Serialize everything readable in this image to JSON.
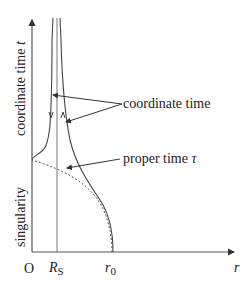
{
  "diagram": {
    "type": "spacetime-diagram",
    "y_axis": {
      "label_text": "coordinate time",
      "label_symbol": "t",
      "lower_label": "singularity"
    },
    "x_axis": {
      "label": "r",
      "origin": "O",
      "ticks": [
        {
          "label": "R",
          "sub": "S"
        },
        {
          "label": "r",
          "sub": "0"
        }
      ]
    },
    "annotations": [
      {
        "text": "coordinate time",
        "symbol": ""
      },
      {
        "text": "proper time",
        "symbol": "τ"
      }
    ],
    "curves": [
      {
        "name": "coordinate-time-outgoing",
        "style": "solid",
        "description": "from r0 rises, asymptotically approaches R_S from outside as t→∞"
      },
      {
        "name": "coordinate-time-ingoing",
        "style": "solid",
        "description": "inside R_S, descends to the singularity at r=0"
      },
      {
        "name": "proper-time",
        "style": "dotted",
        "description": "from r0 crosses R_S in finite proper time and reaches r=0"
      }
    ],
    "colors": {
      "line": "#444444",
      "axis": "#555555",
      "background": "#ffffff"
    }
  }
}
